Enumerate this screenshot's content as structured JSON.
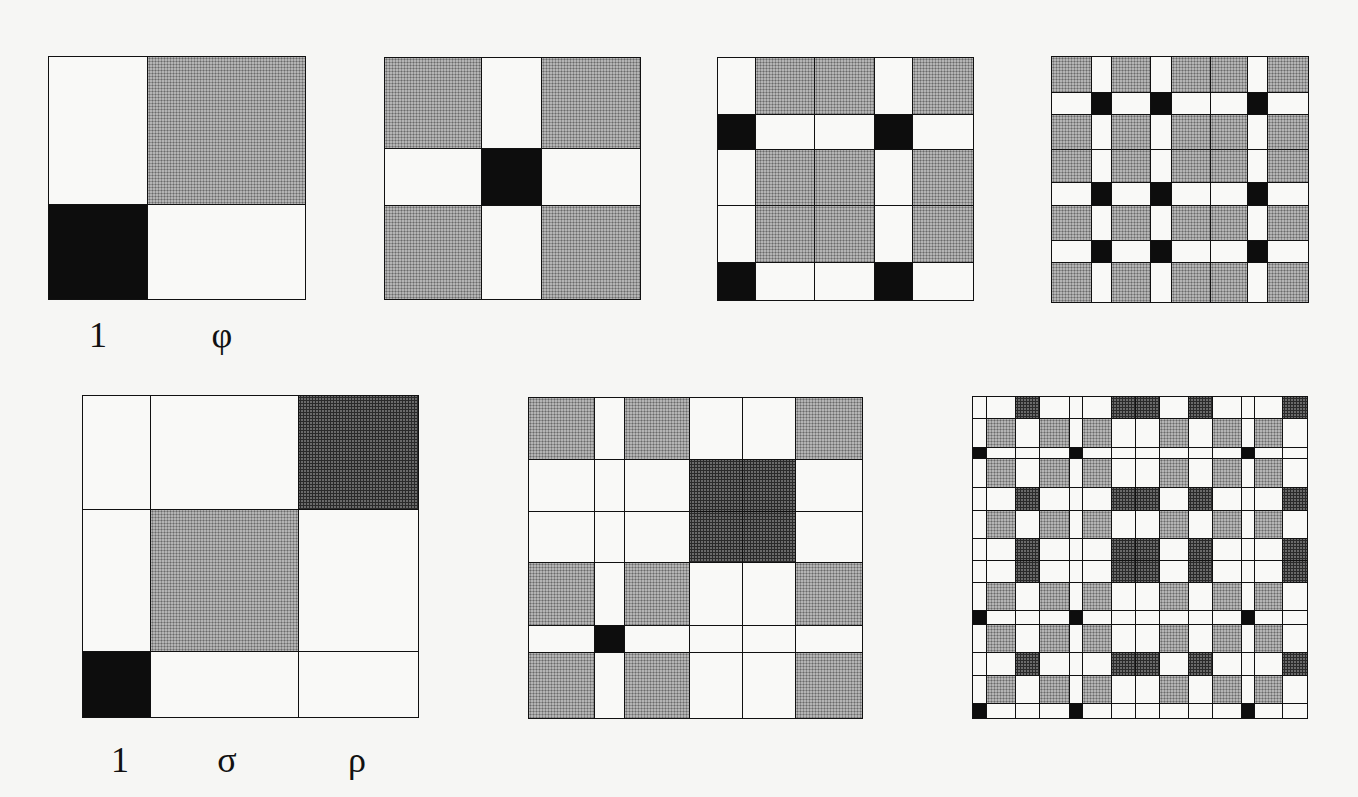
{
  "figure": {
    "fill_colors": {
      "white": "#f9f9f7",
      "black": "#0d0d0d",
      "light_dotted": "#b4b4b4",
      "dark_dotted": "#6a6a6a",
      "line": "#111111",
      "background": "#f6f6f4"
    },
    "fill_rule": {
      "1|1": "black",
      "φ|φ": "light",
      "σ|σ": "light",
      "ρ|ρ": "dark",
      "mixed": "white"
    }
  },
  "panels": [
    {
      "id": "top-1",
      "x": 49,
      "y": 57,
      "cols": [
        {
          "t": "1",
          "w": 99
        },
        {
          "t": "φ",
          "w": 157
        }
      ],
      "rows": [
        {
          "t": "φ",
          "h": 148
        },
        {
          "t": "1",
          "h": 94
        }
      ],
      "labels": [
        {
          "text": "1",
          "x": 98,
          "y": 335
        },
        {
          "text": "φ",
          "x": 222,
          "y": 335
        }
      ]
    },
    {
      "id": "top-2",
      "x": 385,
      "y": 58,
      "cols": [
        {
          "t": "φ",
          "w": 97
        },
        {
          "t": "1",
          "w": 60
        },
        {
          "t": "φ",
          "w": 98
        }
      ],
      "rows": [
        {
          "t": "φ",
          "h": 91
        },
        {
          "t": "1",
          "h": 57
        },
        {
          "t": "φ",
          "h": 93
        }
      ],
      "labels": []
    },
    {
      "id": "top-3",
      "x": 718,
      "y": 58,
      "cols": [
        {
          "t": "1",
          "w": 38
        },
        {
          "t": "φ",
          "w": 59
        },
        {
          "t": "φ",
          "w": 60
        },
        {
          "t": "1",
          "w": 38
        },
        {
          "t": "φ",
          "w": 60
        }
      ],
      "rows": [
        {
          "t": "φ",
          "h": 57
        },
        {
          "t": "1",
          "h": 35
        },
        {
          "t": "φ",
          "h": 56
        },
        {
          "t": "φ",
          "h": 57
        },
        {
          "t": "1",
          "h": 37
        }
      ],
      "labels": []
    },
    {
      "id": "top-4",
      "x": 1052,
      "y": 57,
      "cols": [
        {
          "t": "φ",
          "w": 40
        },
        {
          "t": "1",
          "w": 20
        },
        {
          "t": "φ",
          "w": 39
        },
        {
          "t": "1",
          "w": 21
        },
        {
          "t": "φ",
          "w": 39
        },
        {
          "t": "φ",
          "w": 37
        },
        {
          "t": "1",
          "w": 20
        },
        {
          "t": "φ",
          "w": 40
        }
      ],
      "rows": [
        {
          "t": "φ",
          "h": 36
        },
        {
          "t": "1",
          "h": 22
        },
        {
          "t": "φ",
          "h": 35
        },
        {
          "t": "φ",
          "h": 33
        },
        {
          "t": "1",
          "h": 23
        },
        {
          "t": "φ",
          "h": 35
        },
        {
          "t": "1",
          "h": 22
        },
        {
          "t": "φ",
          "h": 39
        }
      ],
      "labels": []
    },
    {
      "id": "bottom-1",
      "x": 83,
      "y": 396,
      "cols": [
        {
          "t": "1",
          "w": 68
        },
        {
          "t": "σ",
          "w": 148
        },
        {
          "t": "ρ",
          "w": 119
        }
      ],
      "rows": [
        {
          "t": "ρ",
          "h": 114
        },
        {
          "t": "σ",
          "h": 142
        },
        {
          "t": "1",
          "h": 65
        }
      ],
      "labels": [
        {
          "text": "1",
          "x": 120,
          "y": 760
        },
        {
          "text": "σ",
          "x": 227,
          "y": 760
        },
        {
          "text": "ρ",
          "x": 357,
          "y": 760
        }
      ]
    },
    {
      "id": "bottom-2",
      "x": 529,
      "y": 398,
      "cols": [
        {
          "t": "σ",
          "w": 66
        },
        {
          "t": "1",
          "w": 30
        },
        {
          "t": "σ",
          "w": 65
        },
        {
          "t": "ρ",
          "w": 53
        },
        {
          "t": "ρ",
          "w": 53
        },
        {
          "t": "σ",
          "w": 66
        }
      ],
      "rows": [
        {
          "t": "σ",
          "h": 62
        },
        {
          "t": "ρ",
          "h": 52
        },
        {
          "t": "ρ",
          "h": 51
        },
        {
          "t": "σ",
          "h": 63
        },
        {
          "t": "1",
          "h": 27
        },
        {
          "t": "σ",
          "h": 65
        }
      ],
      "labels": []
    },
    {
      "id": "bottom-3",
      "x": 973,
      "y": 397,
      "cols": [
        {
          "t": "1",
          "w": 14
        },
        {
          "t": "σ",
          "w": 29
        },
        {
          "t": "ρ",
          "w": 24
        },
        {
          "t": "σ",
          "w": 30
        },
        {
          "t": "1",
          "w": 13
        },
        {
          "t": "σ",
          "w": 29
        },
        {
          "t": "ρ",
          "w": 24
        },
        {
          "t": "ρ",
          "w": 24
        },
        {
          "t": "σ",
          "w": 29
        },
        {
          "t": "ρ",
          "w": 24
        },
        {
          "t": "σ",
          "w": 29
        },
        {
          "t": "1",
          "w": 13
        },
        {
          "t": "σ",
          "w": 28
        },
        {
          "t": "ρ",
          "w": 24
        }
      ],
      "rows": [
        {
          "t": "ρ",
          "h": 22
        },
        {
          "t": "σ",
          "h": 29
        },
        {
          "t": "1",
          "h": 11
        },
        {
          "t": "σ",
          "h": 29
        },
        {
          "t": "ρ",
          "h": 23
        },
        {
          "t": "σ",
          "h": 28
        },
        {
          "t": "ρ",
          "h": 22
        },
        {
          "t": "ρ",
          "h": 22
        },
        {
          "t": "σ",
          "h": 28
        },
        {
          "t": "1",
          "h": 14
        },
        {
          "t": "σ",
          "h": 28
        },
        {
          "t": "ρ",
          "h": 23
        },
        {
          "t": "σ",
          "h": 28
        },
        {
          "t": "1",
          "h": 14
        }
      ],
      "labels": []
    }
  ]
}
